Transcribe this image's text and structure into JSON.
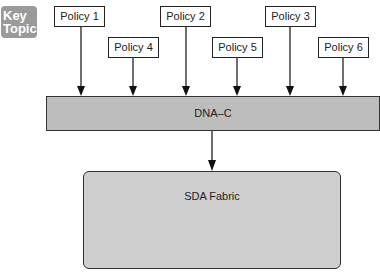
{
  "badge": {
    "line1": "Key",
    "line2": "Topic",
    "color": "#9a9a9a"
  },
  "policies": [
    {
      "label": "Policy 1"
    },
    {
      "label": "Policy 2"
    },
    {
      "label": "Policy 3"
    },
    {
      "label": "Policy 4"
    },
    {
      "label": "Policy 5"
    },
    {
      "label": "Policy 6"
    }
  ],
  "controller": {
    "label": "DNA–C"
  },
  "fabric": {
    "label": "SDA Fabric"
  }
}
